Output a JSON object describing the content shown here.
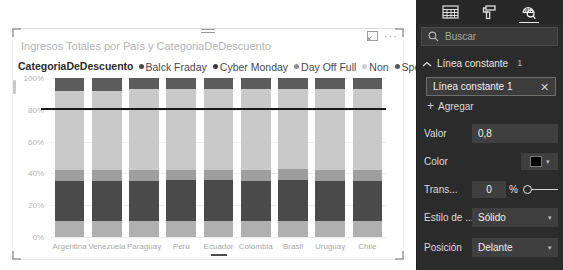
{
  "visual": {
    "title": "Ingresos Totales por País y CategoriaDeDescuento",
    "drag_handle_name": "drag-handle",
    "focus_icon": "focus-mode-icon",
    "more_options": "···"
  },
  "legend": {
    "title": "CategoriaDeDescuento",
    "items": [
      {
        "label": "Balck Fraday",
        "color": "#4a4a4a"
      },
      {
        "label": "Cyber Monday",
        "color": "#3c3c3c"
      },
      {
        "label": "Day Off Full",
        "color": "#8c8c8c"
      },
      {
        "label": "Non",
        "color": "#cfcfcf"
      },
      {
        "label": "Special Day",
        "color": "#5a5a5a"
      }
    ]
  },
  "chart_data": {
    "type": "bar",
    "title": "Ingresos Totales por País y CategoriaDeDescuento",
    "subtype": "100% stacked column",
    "xlabel": "",
    "ylabel": "",
    "ylim": [
      0,
      100
    ],
    "ytick_labels": [
      "100%",
      "80%",
      "60%",
      "40%",
      "20%",
      "0%"
    ],
    "ytick_values": [
      100,
      80,
      60,
      40,
      20,
      0
    ],
    "grid": true,
    "legend_position": "top",
    "categories": [
      "Argentina",
      "Venezuela",
      "Paraguay",
      "Perú",
      "Ecuador",
      "Colombia",
      "Brasil",
      "Uruguay",
      "Chile"
    ],
    "series": [
      {
        "name": "Balck Fraday",
        "color": "#5c5c5c",
        "values": [
          8,
          8,
          7,
          7,
          7,
          7,
          7,
          7,
          7
        ]
      },
      {
        "name": "Cyber Monday",
        "color": "#c9c9c9",
        "values": [
          50,
          50,
          51,
          51,
          51,
          51,
          50,
          51,
          51
        ]
      },
      {
        "name": "Day Off Full",
        "color": "#9e9e9e",
        "values": [
          7,
          7,
          7,
          6,
          6,
          7,
          7,
          7,
          7
        ]
      },
      {
        "name": "Non",
        "color": "#4a4a4a",
        "values": [
          25,
          25,
          25,
          26,
          26,
          25,
          26,
          25,
          25
        ]
      },
      {
        "name": "Special Day",
        "color": "#b0b0b0",
        "values": [
          10,
          10,
          10,
          10,
          10,
          10,
          10,
          10,
          10
        ]
      }
    ],
    "constant_line": {
      "value": 80,
      "label": "Línea constante 1",
      "color": "#1a1a1a"
    }
  },
  "pane": {
    "tabs": [
      {
        "name": "fields-tab",
        "icon": "table-fields-icon",
        "active": false
      },
      {
        "name": "format-tab",
        "icon": "paint-roller-icon",
        "active": false
      },
      {
        "name": "analytics-tab",
        "icon": "magnifier-analytics-icon",
        "active": true
      }
    ],
    "search": {
      "placeholder": "Buscar",
      "icon": "search-icon",
      "value": ""
    },
    "section": {
      "title": "Línea constante",
      "count": "1",
      "chevron": "chevron-up-icon"
    },
    "card": {
      "name": "Línea constante 1",
      "remove": "✕"
    },
    "add": {
      "plus": "+",
      "label": "Agregar"
    },
    "properties": [
      {
        "key": "valor",
        "label": "Valor",
        "value": "0,8",
        "type": "text"
      },
      {
        "key": "color",
        "label": "Color",
        "value": "#000000",
        "type": "color"
      },
      {
        "key": "trans",
        "label": "Trans...",
        "value": "0",
        "unit": "%",
        "type": "slider"
      },
      {
        "key": "estilo",
        "label": "Estilo de ...",
        "value": "Sólido",
        "type": "dropdown"
      },
      {
        "key": "posicion",
        "label": "Posición",
        "value": "Delante",
        "type": "dropdown"
      }
    ]
  }
}
